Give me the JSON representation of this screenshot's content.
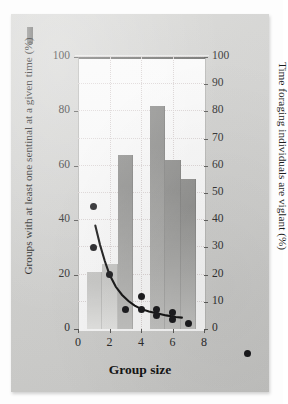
{
  "figure": {
    "corner_marker": "figure-tab",
    "background_color": "#d4d4d2",
    "panel_color": "#fbfbfb"
  },
  "chart_data": {
    "type": "bar",
    "title": "",
    "xlabel": "Group size",
    "ylabel": "Groups with at least one sentinal at a given time (%)",
    "y2label": "Time foraging individuals are viglant (%)",
    "xlim": [
      0,
      8
    ],
    "ylim": [
      0,
      100
    ],
    "y2lim": [
      0,
      100
    ],
    "xticks": [
      0,
      2,
      4,
      6,
      8
    ],
    "yticks": [
      0,
      20,
      40,
      60,
      80,
      100
    ],
    "y2ticks": [
      0,
      10,
      20,
      30,
      40,
      50,
      60,
      70,
      80,
      90,
      100
    ],
    "grid": "dotted",
    "legend": "none",
    "series": [
      {
        "name": "Groups with at least one sentinal at a given time (%)",
        "type": "bar",
        "axis": "left",
        "color": "#9a9a98",
        "x": [
          1,
          2,
          3,
          5,
          6,
          7
        ],
        "values": [
          21,
          24,
          64,
          82,
          62,
          55
        ]
      },
      {
        "name": "Time foraging individuals are viglant (%)",
        "type": "scatter",
        "axis": "right",
        "color": "#17171a",
        "points": [
          [
            1,
            45
          ],
          [
            1,
            30
          ],
          [
            2,
            20
          ],
          [
            3,
            7
          ],
          [
            4,
            12
          ],
          [
            4,
            7
          ],
          [
            5,
            7
          ],
          [
            5,
            5
          ],
          [
            6,
            6
          ],
          [
            6,
            3.5
          ],
          [
            7,
            2
          ]
        ]
      },
      {
        "name": "fitted decay curve",
        "type": "line",
        "axis": "right",
        "color": "#101010",
        "points": [
          [
            1.1,
            38
          ],
          [
            1.4,
            31
          ],
          [
            1.7,
            25
          ],
          [
            2.0,
            20
          ],
          [
            2.4,
            15.5
          ],
          [
            2.8,
            12.5
          ],
          [
            3.2,
            10.3
          ],
          [
            3.6,
            8.6
          ],
          [
            4.0,
            7.4
          ],
          [
            4.5,
            6.4
          ],
          [
            5.0,
            5.8
          ],
          [
            5.6,
            5.0
          ],
          [
            6.2,
            4.4
          ],
          [
            6.6,
            4.2
          ]
        ]
      }
    ],
    "xtick_labels": [
      "0",
      "2",
      "4",
      "6",
      "8"
    ],
    "ytick_labels": [
      "0",
      "20",
      "40",
      "60",
      "80",
      "100"
    ],
    "y2tick_labels": [
      "0",
      "10",
      "20",
      "30",
      "40",
      "50",
      "60",
      "70",
      "80",
      "90",
      "100"
    ],
    "legend_marker": "scatter-dot"
  }
}
